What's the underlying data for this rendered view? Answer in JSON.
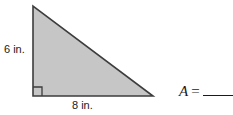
{
  "figure": {
    "shape_name": "right-triangle",
    "fill_color": "#c6c6c6",
    "stroke_color": "#3d3d3d",
    "background_color": "#ffffff",
    "vertices": {
      "apex": [
        33,
        6
      ],
      "bottom_left": [
        33,
        96
      ],
      "bottom_right": [
        153,
        96
      ]
    },
    "right_angle_marker": {
      "name": "right-angle-marker",
      "corner": [
        33,
        96
      ],
      "size": 9
    }
  },
  "labels": {
    "height": "6 in.",
    "base": "8 in."
  },
  "answer": {
    "variable": "A",
    "equals": "=",
    "blank_value": ""
  }
}
